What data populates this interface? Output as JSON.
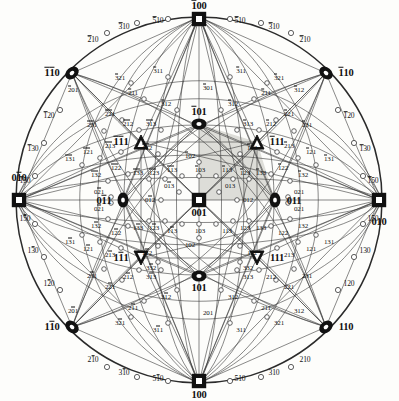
{
  "figure": {
    "type": "stereographic-projection",
    "system": "cubic",
    "projection_center": "001",
    "title_visible": false,
    "background_color": "#fdfdfb",
    "line_color": "#3a3a3a",
    "shade_color": "#d8d8d2",
    "radius_px": 183,
    "center_px": [
      199,
      200
    ]
  },
  "symbols": {
    "square": "open square = <100> pole",
    "ellipse": "filled ellipse = <110> pole",
    "triangle": "filled triangle = <111> pole",
    "circle": "small open circle = minor pole"
  },
  "poles": {
    "primary_100": [
      {
        "label": "100",
        "bar": "",
        "x": 199,
        "y": 381,
        "marker": "square",
        "size": "major"
      },
      {
        "label": "100",
        "bar": "1",
        "x": 199,
        "y": 19,
        "marker": "square",
        "size": "major"
      },
      {
        "label": "010",
        "bar": "",
        "x": 379,
        "y": 200,
        "marker": "square",
        "size": "major"
      },
      {
        "label": "010",
        "bar": "2",
        "x": 19,
        "y": 200,
        "marker": "square",
        "size": "major"
      },
      {
        "label": "001",
        "bar": "",
        "x": 199,
        "y": 200,
        "marker": "square",
        "size": "major"
      }
    ],
    "primary_110": [
      {
        "label": "110",
        "bar": "",
        "x": 326,
        "y": 327,
        "marker": "ellipse",
        "size": "major"
      },
      {
        "label": "110",
        "bar": "1",
        "x": 326,
        "y": 73,
        "marker": "ellipse",
        "size": "major"
      },
      {
        "label": "110",
        "bar": "12",
        "x": 72,
        "y": 73,
        "marker": "ellipse",
        "size": "major"
      },
      {
        "label": "110",
        "bar": "2",
        "x": 72,
        "y": 327,
        "marker": "ellipse",
        "size": "major"
      },
      {
        "label": "011",
        "bar": "",
        "x": 275,
        "y": 200,
        "marker": "ellipse",
        "size": "major"
      },
      {
        "label": "011",
        "bar": "2",
        "x": 123,
        "y": 200,
        "marker": "ellipse",
        "size": "major"
      },
      {
        "label": "101",
        "bar": "",
        "x": 199,
        "y": 276,
        "marker": "ellipse",
        "size": "major"
      },
      {
        "label": "101",
        "bar": "1",
        "x": 199,
        "y": 124,
        "marker": "ellipse",
        "size": "major"
      }
    ],
    "primary_111": [
      {
        "label": "111",
        "bar": "",
        "x": 257,
        "y": 258,
        "marker": "triangle",
        "size": "major"
      },
      {
        "label": "111",
        "bar": "1",
        "x": 257,
        "y": 142,
        "marker": "triangle",
        "size": "major"
      },
      {
        "label": "111",
        "bar": "12",
        "x": 141,
        "y": 142,
        "marker": "triangle",
        "size": "major"
      },
      {
        "label": "111",
        "bar": "2",
        "x": 141,
        "y": 258,
        "marker": "triangle",
        "size": "major"
      }
    ]
  },
  "rim_labels": [
    {
      "label": "510",
      "bar": "1",
      "x": 158,
      "y": 21
    },
    {
      "label": "310",
      "bar": "1",
      "x": 124,
      "y": 27
    },
    {
      "label": "210",
      "bar": "1",
      "x": 93,
      "y": 40
    },
    {
      "label": "120",
      "bar": "1",
      "x": 49,
      "y": 116
    },
    {
      "label": "130",
      "bar": "1",
      "x": 33,
      "y": 149
    },
    {
      "label": "150",
      "bar": "1",
      "x": 25,
      "y": 181
    },
    {
      "label": "150",
      "bar": "2",
      "x": 25,
      "y": 219
    },
    {
      "label": "130",
      "bar": "2",
      "x": 33,
      "y": 251
    },
    {
      "label": "120",
      "bar": "2",
      "x": 49,
      "y": 284
    },
    {
      "label": "210",
      "bar": "2",
      "x": 93,
      "y": 360
    },
    {
      "label": "310",
      "bar": "2",
      "x": 124,
      "y": 373
    },
    {
      "label": "510",
      "bar": "2",
      "x": 158,
      "y": 379
    },
    {
      "label": "510",
      "bar": "",
      "x": 240,
      "y": 379
    },
    {
      "label": "310",
      "bar": "",
      "x": 274,
      "y": 373
    },
    {
      "label": "210",
      "bar": "",
      "x": 305,
      "y": 360
    },
    {
      "label": "120",
      "bar": "",
      "x": 349,
      "y": 284
    },
    {
      "label": "130",
      "bar": "",
      "x": 365,
      "y": 251
    },
    {
      "label": "150",
      "bar": "",
      "x": 373,
      "y": 219
    },
    {
      "label": "150",
      "bar": "1",
      "x": 373,
      "y": 181
    },
    {
      "label": "130",
      "bar": "1",
      "x": 365,
      "y": 149
    },
    {
      "label": "120",
      "bar": "1",
      "x": 349,
      "y": 116
    },
    {
      "label": "510",
      "bar": "1",
      "x": 240,
      "y": 21
    },
    {
      "label": "310",
      "bar": "1",
      "x": 274,
      "y": 27
    },
    {
      "label": "210",
      "bar": "1",
      "x": 305,
      "y": 40
    }
  ],
  "minor_poles": [
    {
      "label": "321",
      "bar": "1",
      "x": 120,
      "y": 78
    },
    {
      "label": "311",
      "bar": "1",
      "x": 158,
      "y": 71
    },
    {
      "label": "311",
      "bar": "1",
      "x": 241,
      "y": 71
    },
    {
      "label": "321",
      "bar": "1",
      "x": 279,
      "y": 78
    },
    {
      "label": "211",
      "bar": "1",
      "x": 133,
      "y": 93
    },
    {
      "label": "211",
      "bar": "1",
      "x": 266,
      "y": 93
    },
    {
      "label": "221",
      "bar": "12",
      "x": 110,
      "y": 114
    },
    {
      "label": "221",
      "bar": "1",
      "x": 289,
      "y": 114
    },
    {
      "label": "231",
      "bar": "12",
      "x": 92,
      "y": 125
    },
    {
      "label": "231",
      "bar": "1",
      "x": 307,
      "y": 125
    },
    {
      "label": "301",
      "bar": "1",
      "x": 208,
      "y": 88
    },
    {
      "label": "312",
      "bar": "1",
      "x": 166,
      "y": 104
    },
    {
      "label": "312",
      "bar": "1",
      "x": 233,
      "y": 104
    },
    {
      "label": "201",
      "bar": "1",
      "x": 73,
      "y": 90
    },
    {
      "label": "312",
      "bar": "1",
      "x": 299,
      "y": 90
    },
    {
      "label": "212",
      "bar": "12",
      "x": 128,
      "y": 124
    },
    {
      "label": "212",
      "bar": "1",
      "x": 271,
      "y": 124
    },
    {
      "label": "313",
      "bar": "12",
      "x": 151,
      "y": 124
    },
    {
      "label": "313",
      "bar": "1",
      "x": 248,
      "y": 124
    },
    {
      "label": "121",
      "bar": "12",
      "x": 88,
      "y": 152
    },
    {
      "label": "121",
      "bar": "1",
      "x": 311,
      "y": 152
    },
    {
      "label": "131",
      "bar": "12",
      "x": 70,
      "y": 159
    },
    {
      "label": "131",
      "bar": "1",
      "x": 329,
      "y": 159
    },
    {
      "label": "213",
      "bar": "12",
      "x": 110,
      "y": 146
    },
    {
      "label": "213",
      "bar": "1",
      "x": 289,
      "y": 146
    },
    {
      "label": "112",
      "bar": "12",
      "x": 147,
      "y": 148
    },
    {
      "label": "112",
      "bar": "1",
      "x": 252,
      "y": 148
    },
    {
      "label": "122",
      "bar": "12",
      "x": 116,
      "y": 168
    },
    {
      "label": "122",
      "bar": "1",
      "x": 283,
      "y": 168
    },
    {
      "label": "132",
      "bar": "12",
      "x": 96,
      "y": 175
    },
    {
      "label": "132",
      "bar": "1",
      "x": 303,
      "y": 175
    },
    {
      "label": "133",
      "bar": "12",
      "x": 138,
      "y": 173
    },
    {
      "label": "133",
      "bar": "1",
      "x": 261,
      "y": 173
    },
    {
      "label": "123",
      "bar": "12",
      "x": 154,
      "y": 173
    },
    {
      "label": "123",
      "bar": "1",
      "x": 245,
      "y": 173
    },
    {
      "label": "113",
      "bar": "12",
      "x": 172,
      "y": 170
    },
    {
      "label": "113",
      "bar": "1",
      "x": 227,
      "y": 170
    },
    {
      "label": "102",
      "bar": "1",
      "x": 190,
      "y": 156
    },
    {
      "label": "103",
      "bar": "1",
      "x": 200,
      "y": 170
    },
    {
      "label": "013",
      "bar": "2",
      "x": 169,
      "y": 186
    },
    {
      "label": "013",
      "bar": "",
      "x": 230,
      "y": 186
    },
    {
      "label": "012",
      "bar": "2",
      "x": 150,
      "y": 200
    },
    {
      "label": "012",
      "bar": "",
      "x": 248,
      "y": 200
    },
    {
      "label": "021",
      "bar": "2",
      "x": 99,
      "y": 192
    },
    {
      "label": "021",
      "bar": "",
      "x": 299,
      "y": 192
    },
    {
      "label": "021",
      "bar": "",
      "x": 299,
      "y": 209
    },
    {
      "label": "021",
      "bar": "2",
      "x": 99,
      "y": 209
    },
    {
      "label": "102",
      "bar": "",
      "x": 190,
      "y": 245
    },
    {
      "label": "103",
      "bar": "",
      "x": 200,
      "y": 231
    },
    {
      "label": "113",
      "bar": "2",
      "x": 172,
      "y": 231
    },
    {
      "label": "113",
      "bar": "",
      "x": 227,
      "y": 231
    },
    {
      "label": "123",
      "bar": "2",
      "x": 154,
      "y": 228
    },
    {
      "label": "123",
      "bar": "",
      "x": 245,
      "y": 228
    },
    {
      "label": "133",
      "bar": "2",
      "x": 138,
      "y": 228
    },
    {
      "label": "133",
      "bar": "",
      "x": 261,
      "y": 228
    },
    {
      "label": "132",
      "bar": "2",
      "x": 96,
      "y": 226
    },
    {
      "label": "132",
      "bar": "",
      "x": 303,
      "y": 226
    },
    {
      "label": "122",
      "bar": "2",
      "x": 116,
      "y": 233
    },
    {
      "label": "122",
      "bar": "",
      "x": 283,
      "y": 233
    },
    {
      "label": "112",
      "bar": "2",
      "x": 147,
      "y": 253
    },
    {
      "label": "112",
      "bar": "",
      "x": 252,
      "y": 253
    },
    {
      "label": "213",
      "bar": "2",
      "x": 110,
      "y": 255
    },
    {
      "label": "213",
      "bar": "",
      "x": 289,
      "y": 255
    },
    {
      "label": "131",
      "bar": "2",
      "x": 70,
      "y": 242
    },
    {
      "label": "131",
      "bar": "",
      "x": 329,
      "y": 242
    },
    {
      "label": "121",
      "bar": "2",
      "x": 88,
      "y": 249
    },
    {
      "label": "121",
      "bar": "",
      "x": 311,
      "y": 249
    },
    {
      "label": "313",
      "bar": "2",
      "x": 151,
      "y": 277
    },
    {
      "label": "313",
      "bar": "",
      "x": 248,
      "y": 277
    },
    {
      "label": "212",
      "bar": "2",
      "x": 128,
      "y": 277
    },
    {
      "label": "212",
      "bar": "",
      "x": 271,
      "y": 277
    },
    {
      "label": "312",
      "bar": "2",
      "x": 166,
      "y": 297
    },
    {
      "label": "312",
      "bar": "",
      "x": 233,
      "y": 297
    },
    {
      "label": "201",
      "bar": "2",
      "x": 73,
      "y": 311
    },
    {
      "label": "312",
      "bar": "",
      "x": 299,
      "y": 311
    },
    {
      "label": "221",
      "bar": "2",
      "x": 110,
      "y": 287
    },
    {
      "label": "221",
      "bar": "",
      "x": 289,
      "y": 287
    },
    {
      "label": "231",
      "bar": "2",
      "x": 92,
      "y": 276
    },
    {
      "label": "231",
      "bar": "",
      "x": 307,
      "y": 276
    },
    {
      "label": "211",
      "bar": "2",
      "x": 133,
      "y": 308
    },
    {
      "label": "211",
      "bar": "",
      "x": 266,
      "y": 308
    },
    {
      "label": "321",
      "bar": "2",
      "x": 120,
      "y": 323
    },
    {
      "label": "321",
      "bar": "",
      "x": 279,
      "y": 323
    },
    {
      "label": "311",
      "bar": "2",
      "x": 158,
      "y": 330
    },
    {
      "label": "311",
      "bar": "",
      "x": 241,
      "y": 330
    },
    {
      "label": "201",
      "bar": "",
      "x": 208,
      "y": 313
    },
    {
      "label": "332",
      "bar": "",
      "x": 248,
      "y": 268
    },
    {
      "label": "332",
      "bar": "2",
      "x": 151,
      "y": 268
    }
  ]
}
